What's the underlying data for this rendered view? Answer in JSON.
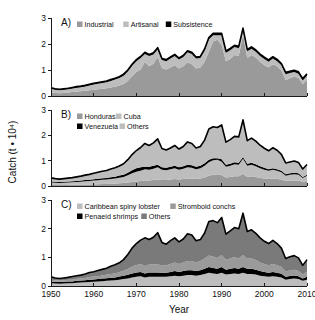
{
  "figure": {
    "axis_title_y": "Catch (t • 10⁴)",
    "axis_title_x": "Year",
    "x_ticks": [
      "1950",
      "1960",
      "1970",
      "1980",
      "1990",
      "2000",
      "2010"
    ],
    "y_ticks": [
      "0",
      "1",
      "2",
      "3"
    ],
    "panel_labels": {
      "a": "A)",
      "b": "B)",
      "c": "C)"
    }
  },
  "colors": {
    "light_gray": "#bdbdbd",
    "mid_gray": "#9a9a9a",
    "dark_gray": "#7a7a7a",
    "black": "#000000",
    "axis": "#1a1a1a",
    "background": "#ffffff"
  },
  "chart_data": [
    {
      "type": "area",
      "title": "A)",
      "stacked": true,
      "xlabel": "Year",
      "ylabel": "Catch (t • 10⁴)",
      "xlim": [
        1950,
        2010
      ],
      "ylim": [
        0,
        3
      ],
      "grid": false,
      "legend_position": "top-left",
      "x": [
        1950,
        1951,
        1952,
        1953,
        1954,
        1955,
        1956,
        1957,
        1958,
        1959,
        1960,
        1961,
        1962,
        1963,
        1964,
        1965,
        1966,
        1967,
        1968,
        1969,
        1970,
        1971,
        1972,
        1973,
        1974,
        1975,
        1976,
        1977,
        1978,
        1979,
        1980,
        1981,
        1982,
        1983,
        1984,
        1985,
        1986,
        1987,
        1988,
        1989,
        1990,
        1991,
        1992,
        1993,
        1994,
        1995,
        1996,
        1997,
        1998,
        1999,
        2000,
        2001,
        2002,
        2003,
        2004,
        2005,
        2006,
        2007,
        2008,
        2009,
        2010
      ],
      "series": [
        {
          "name": "Industrial",
          "color": "#9a9a9a",
          "values": [
            0.14,
            0.12,
            0.11,
            0.12,
            0.13,
            0.15,
            0.17,
            0.18,
            0.2,
            0.22,
            0.24,
            0.26,
            0.28,
            0.3,
            0.33,
            0.36,
            0.4,
            0.46,
            0.58,
            0.76,
            0.92,
            1.02,
            1.32,
            1.14,
            1.24,
            1.5,
            1.08,
            1.02,
            1.1,
            1.18,
            1.06,
            1.14,
            1.3,
            1.22,
            1.06,
            1.1,
            1.32,
            1.7,
            2.1,
            2.16,
            1.96,
            1.34,
            1.42,
            1.58,
            1.54,
            2.36,
            1.46,
            1.58,
            1.48,
            1.32,
            1.18,
            1.1,
            1.22,
            1.14,
            0.98,
            0.62,
            0.68,
            0.74,
            0.7,
            0.46,
            0.62
          ]
        },
        {
          "name": "Artisanal",
          "color": "#bdbdbd",
          "values": [
            0.14,
            0.12,
            0.11,
            0.12,
            0.13,
            0.14,
            0.15,
            0.16,
            0.17,
            0.18,
            0.2,
            0.21,
            0.22,
            0.23,
            0.25,
            0.27,
            0.29,
            0.32,
            0.36,
            0.4,
            0.42,
            0.44,
            0.3,
            0.4,
            0.36,
            0.3,
            0.3,
            0.32,
            0.34,
            0.36,
            0.34,
            0.36,
            0.38,
            0.4,
            0.38,
            0.36,
            0.42,
            0.48,
            0.24,
            0.18,
            0.38,
            0.32,
            0.34,
            0.3,
            0.3,
            0.18,
            0.26,
            0.24,
            0.22,
            0.22,
            0.24,
            0.22,
            0.22,
            0.2,
            0.2,
            0.22,
            0.2,
            0.18,
            0.16,
            0.14,
            0.16
          ]
        },
        {
          "name": "Subsistence",
          "color": "#000000",
          "values": [
            0.04,
            0.04,
            0.04,
            0.04,
            0.04,
            0.04,
            0.04,
            0.04,
            0.04,
            0.05,
            0.05,
            0.05,
            0.05,
            0.05,
            0.05,
            0.05,
            0.05,
            0.06,
            0.06,
            0.06,
            0.06,
            0.06,
            0.06,
            0.06,
            0.06,
            0.06,
            0.06,
            0.06,
            0.06,
            0.06,
            0.06,
            0.06,
            0.06,
            0.06,
            0.06,
            0.06,
            0.07,
            0.07,
            0.07,
            0.07,
            0.07,
            0.07,
            0.07,
            0.07,
            0.07,
            0.07,
            0.07,
            0.07,
            0.07,
            0.07,
            0.07,
            0.07,
            0.07,
            0.07,
            0.07,
            0.07,
            0.07,
            0.07,
            0.07,
            0.07,
            0.07
          ]
        }
      ],
      "legend": [
        "Industrial",
        "Artisanal",
        "Subsistence"
      ]
    },
    {
      "type": "area",
      "title": "B)",
      "stacked": true,
      "xlabel": "Year",
      "ylabel": "Catch (t • 10⁴)",
      "xlim": [
        1950,
        2010
      ],
      "ylim": [
        0,
        3
      ],
      "grid": false,
      "legend_position": "top-left",
      "x": [
        1950,
        1951,
        1952,
        1953,
        1954,
        1955,
        1956,
        1957,
        1958,
        1959,
        1960,
        1961,
        1962,
        1963,
        1964,
        1965,
        1966,
        1967,
        1968,
        1969,
        1970,
        1971,
        1972,
        1973,
        1974,
        1975,
        1976,
        1977,
        1978,
        1979,
        1980,
        1981,
        1982,
        1983,
        1984,
        1985,
        1986,
        1987,
        1988,
        1989,
        1990,
        1991,
        1992,
        1993,
        1994,
        1995,
        1996,
        1997,
        1998,
        1999,
        2000,
        2001,
        2002,
        2003,
        2004,
        2005,
        2006,
        2007,
        2008,
        2009,
        2010
      ],
      "series": [
        {
          "name": "Honduras",
          "color": "#9a9a9a",
          "values": [
            0.04,
            0.04,
            0.04,
            0.04,
            0.04,
            0.05,
            0.05,
            0.05,
            0.06,
            0.06,
            0.07,
            0.07,
            0.08,
            0.08,
            0.09,
            0.1,
            0.11,
            0.12,
            0.14,
            0.16,
            0.18,
            0.2,
            0.22,
            0.22,
            0.24,
            0.26,
            0.24,
            0.24,
            0.26,
            0.28,
            0.26,
            0.28,
            0.3,
            0.3,
            0.28,
            0.3,
            0.34,
            0.4,
            0.44,
            0.46,
            0.42,
            0.34,
            0.36,
            0.38,
            0.38,
            0.48,
            0.36,
            0.38,
            0.36,
            0.32,
            0.3,
            0.28,
            0.3,
            0.28,
            0.26,
            0.2,
            0.22,
            0.22,
            0.22,
            0.16,
            0.2
          ]
        },
        {
          "name": "Cuba",
          "color": "#bdbdbd",
          "values": [
            0.1,
            0.09,
            0.08,
            0.09,
            0.1,
            0.1,
            0.11,
            0.12,
            0.13,
            0.14,
            0.15,
            0.16,
            0.17,
            0.18,
            0.19,
            0.2,
            0.22,
            0.24,
            0.28,
            0.34,
            0.38,
            0.4,
            0.44,
            0.42,
            0.44,
            0.48,
            0.4,
            0.38,
            0.4,
            0.42,
            0.38,
            0.4,
            0.44,
            0.42,
            0.38,
            0.4,
            0.46,
            0.54,
            0.58,
            0.58,
            0.54,
            0.42,
            0.44,
            0.48,
            0.46,
            0.6,
            0.44,
            0.46,
            0.42,
            0.38,
            0.34,
            0.32,
            0.34,
            0.32,
            0.28,
            0.2,
            0.22,
            0.24,
            0.22,
            0.16,
            0.2
          ]
        },
        {
          "name": "Venezuela",
          "color": "#000000",
          "values": [
            0.04,
            0.04,
            0.04,
            0.04,
            0.04,
            0.04,
            0.04,
            0.05,
            0.05,
            0.05,
            0.05,
            0.06,
            0.06,
            0.06,
            0.07,
            0.07,
            0.08,
            0.08,
            0.1,
            0.12,
            0.14,
            0.14,
            0.1,
            0.12,
            0.12,
            0.1,
            0.1,
            0.1,
            0.1,
            0.1,
            0.1,
            0.1,
            0.1,
            0.1,
            0.1,
            0.1,
            0.1,
            0.1,
            0.08,
            0.06,
            0.1,
            0.08,
            0.08,
            0.08,
            0.08,
            0.06,
            0.08,
            0.08,
            0.08,
            0.08,
            0.08,
            0.06,
            0.06,
            0.06,
            0.06,
            0.06,
            0.06,
            0.06,
            0.06,
            0.04,
            0.04
          ]
        },
        {
          "name": "Others",
          "color": "#bdbdbd",
          "values": [
            0.14,
            0.12,
            0.11,
            0.12,
            0.13,
            0.14,
            0.16,
            0.17,
            0.19,
            0.21,
            0.23,
            0.25,
            0.27,
            0.29,
            0.32,
            0.35,
            0.38,
            0.44,
            0.52,
            0.62,
            0.7,
            0.78,
            0.92,
            0.84,
            0.9,
            1.02,
            0.74,
            0.7,
            0.74,
            0.8,
            0.72,
            0.78,
            0.9,
            0.86,
            0.74,
            0.76,
            0.91,
            1.21,
            1.24,
            1.21,
            1.35,
            0.89,
            0.95,
            1.02,
            1.02,
            1.47,
            0.91,
            0.97,
            0.91,
            0.83,
            0.77,
            0.73,
            0.81,
            0.75,
            0.65,
            0.45,
            0.45,
            0.47,
            0.43,
            0.31,
            0.41
          ]
        }
      ],
      "legend": [
        "Honduras",
        "Cuba",
        "Venezuela",
        "Others"
      ]
    },
    {
      "type": "area",
      "title": "C)",
      "stacked": true,
      "xlabel": "Year",
      "ylabel": "Catch (t • 10⁴)",
      "xlim": [
        1950,
        2010
      ],
      "ylim": [
        0,
        3
      ],
      "grid": false,
      "legend_position": "top-left",
      "x": [
        1950,
        1951,
        1952,
        1953,
        1954,
        1955,
        1956,
        1957,
        1958,
        1959,
        1960,
        1961,
        1962,
        1963,
        1964,
        1965,
        1966,
        1967,
        1968,
        1969,
        1970,
        1971,
        1972,
        1973,
        1974,
        1975,
        1976,
        1977,
        1978,
        1979,
        1980,
        1981,
        1982,
        1983,
        1984,
        1985,
        1986,
        1987,
        1988,
        1989,
        1990,
        1991,
        1992,
        1993,
        1994,
        1995,
        1996,
        1997,
        1998,
        1999,
        2000,
        2001,
        2002,
        2003,
        2004,
        2005,
        2006,
        2007,
        2008,
        2009,
        2010
      ],
      "series": [
        {
          "name": "Caribbean spiny lobster",
          "color": "#bdbdbd",
          "values": [
            0.1,
            0.09,
            0.08,
            0.09,
            0.1,
            0.1,
            0.11,
            0.12,
            0.13,
            0.14,
            0.15,
            0.16,
            0.17,
            0.18,
            0.19,
            0.2,
            0.22,
            0.24,
            0.26,
            0.3,
            0.32,
            0.34,
            0.3,
            0.32,
            0.32,
            0.32,
            0.32,
            0.32,
            0.34,
            0.36,
            0.34,
            0.36,
            0.38,
            0.38,
            0.36,
            0.38,
            0.42,
            0.46,
            0.44,
            0.42,
            0.46,
            0.4,
            0.42,
            0.44,
            0.42,
            0.46,
            0.42,
            0.42,
            0.4,
            0.36,
            0.34,
            0.32,
            0.34,
            0.32,
            0.3,
            0.22,
            0.24,
            0.26,
            0.24,
            0.18,
            0.22
          ]
        },
        {
          "name": "Penaeid shrimps",
          "color": "#000000",
          "values": [
            0.06,
            0.06,
            0.06,
            0.06,
            0.06,
            0.06,
            0.07,
            0.07,
            0.07,
            0.08,
            0.08,
            0.08,
            0.09,
            0.09,
            0.1,
            0.1,
            0.11,
            0.12,
            0.13,
            0.14,
            0.15,
            0.15,
            0.14,
            0.15,
            0.15,
            0.15,
            0.14,
            0.14,
            0.15,
            0.16,
            0.15,
            0.16,
            0.17,
            0.17,
            0.16,
            0.17,
            0.18,
            0.2,
            0.19,
            0.18,
            0.2,
            0.17,
            0.18,
            0.19,
            0.18,
            0.2,
            0.18,
            0.18,
            0.17,
            0.16,
            0.15,
            0.14,
            0.15,
            0.14,
            0.13,
            0.1,
            0.11,
            0.11,
            0.1,
            0.08,
            0.1
          ]
        },
        {
          "name": "Stromboid conchs",
          "color": "#9a9a9a",
          "values": [
            0.06,
            0.05,
            0.05,
            0.05,
            0.06,
            0.06,
            0.07,
            0.07,
            0.08,
            0.09,
            0.1,
            0.1,
            0.11,
            0.12,
            0.13,
            0.14,
            0.15,
            0.17,
            0.2,
            0.24,
            0.26,
            0.28,
            0.26,
            0.28,
            0.28,
            0.28,
            0.26,
            0.26,
            0.28,
            0.3,
            0.28,
            0.3,
            0.32,
            0.32,
            0.3,
            0.32,
            0.36,
            0.4,
            0.4,
            0.38,
            0.42,
            0.34,
            0.36,
            0.38,
            0.36,
            0.42,
            0.36,
            0.36,
            0.34,
            0.3,
            0.28,
            0.26,
            0.28,
            0.26,
            0.24,
            0.18,
            0.2,
            0.2,
            0.18,
            0.14,
            0.18
          ]
        },
        {
          "name": "Others",
          "color": "#7a7a7a",
          "values": [
            0.1,
            0.08,
            0.07,
            0.08,
            0.08,
            0.11,
            0.11,
            0.12,
            0.14,
            0.16,
            0.17,
            0.2,
            0.21,
            0.23,
            0.27,
            0.3,
            0.33,
            0.39,
            0.51,
            0.64,
            0.75,
            0.83,
            0.98,
            0.87,
            0.95,
            1.11,
            0.8,
            0.74,
            0.81,
            0.86,
            0.77,
            0.82,
            0.95,
            0.91,
            0.76,
            0.75,
            0.89,
            1.19,
            1.25,
            1.23,
            1.31,
            0.9,
            0.96,
            1.03,
            1.04,
            1.46,
            0.94,
            1.0,
            0.93,
            0.86,
            0.79,
            0.76,
            0.82,
            0.76,
            0.65,
            0.46,
            0.47,
            0.49,
            0.46,
            0.32,
            0.42
          ]
        }
      ],
      "legend": [
        "Caribbean spiny lobster",
        "Stromboid conchs",
        "Penaeid shrimps",
        "Others"
      ]
    }
  ]
}
